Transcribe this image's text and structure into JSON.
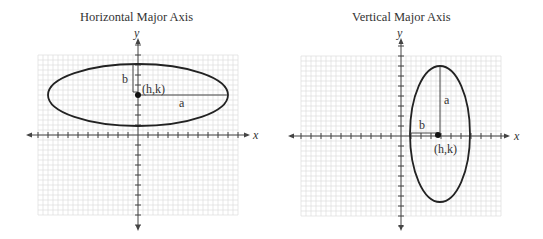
{
  "panels": [
    {
      "title": "Horizontal Major Axis",
      "x_label": "x",
      "y_label": "y",
      "center_label": "(h,k)",
      "major_label": "a",
      "minor_label": "b",
      "orientation": "horizontal"
    },
    {
      "title": "Vertical Major Axis",
      "x_label": "x",
      "y_label": "y",
      "center_label": "(h,k)",
      "major_label": "a",
      "minor_label": "b",
      "orientation": "vertical"
    }
  ],
  "chart_data": [
    {
      "type": "diagram",
      "title": "Horizontal Major Axis",
      "xlabel": "x",
      "ylabel": "y",
      "grid": true,
      "grid_units": {
        "x": [
          -10,
          10
        ],
        "y": [
          -8,
          8
        ]
      },
      "ellipse": {
        "center": [
          0,
          4
        ],
        "a": 9,
        "b": 3,
        "major_axis": "horizontal"
      },
      "annotations": [
        "(h,k)",
        "a",
        "b"
      ]
    },
    {
      "type": "diagram",
      "title": "Vertical Major Axis",
      "xlabel": "x",
      "ylabel": "y",
      "grid": true,
      "grid_units": {
        "x": [
          -10,
          10
        ],
        "y": [
          -8,
          8
        ]
      },
      "ellipse": {
        "center": [
          4,
          0
        ],
        "a": 7,
        "b": 3,
        "major_axis": "vertical"
      },
      "annotations": [
        "(h,k)",
        "a",
        "b"
      ]
    }
  ]
}
